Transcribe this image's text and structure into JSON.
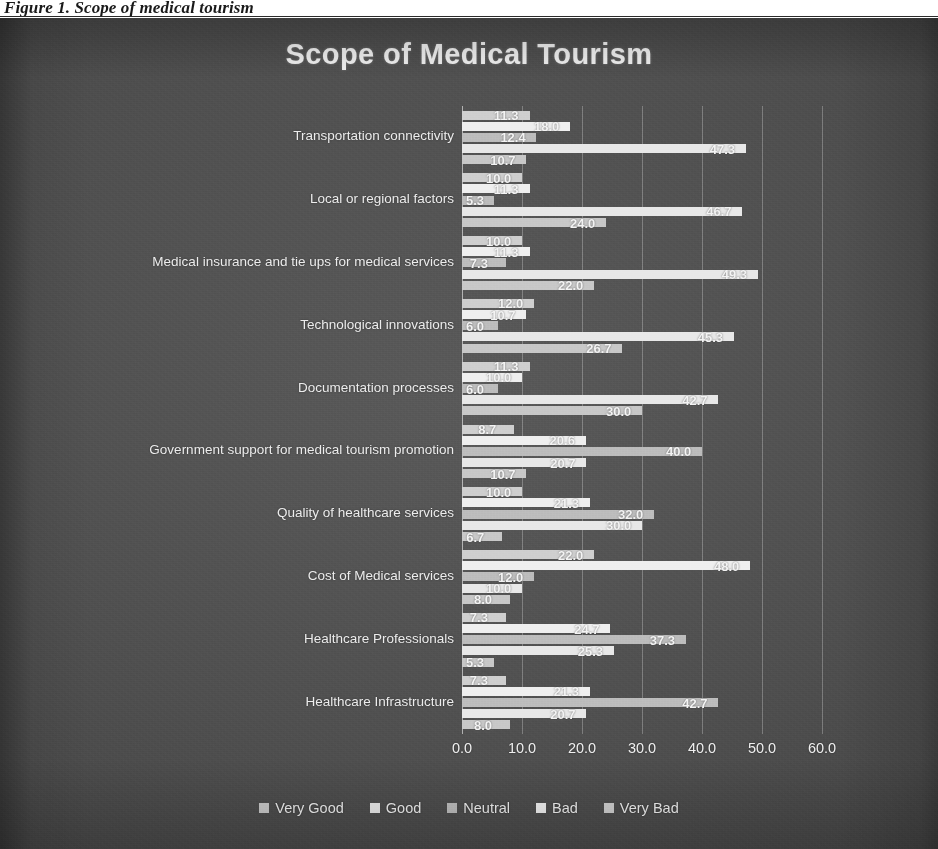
{
  "caption": "Figure 1. Scope of medical tourism",
  "chart_data": {
    "type": "bar",
    "orientation": "horizontal",
    "title": "Scope of Medical Tourism",
    "xlabel": "",
    "ylabel": "",
    "xlim": [
      0.0,
      60.0
    ],
    "xticks": [
      "0.0",
      "10.0",
      "20.0",
      "30.0",
      "40.0",
      "50.0",
      "60.0"
    ],
    "grid": true,
    "legend_position": "bottom",
    "bar_order_top_to_bottom": [
      "Very Bad",
      "Bad",
      "Neutral",
      "Good",
      "Very Good"
    ],
    "categories": [
      "Transportation connectivity",
      "Local or regional factors",
      "Medical insurance and tie ups for medical services",
      "Technological innovations",
      "Documentation processes",
      "Government support for medical tourism promotion",
      "Quality of healthcare services",
      "Cost of Medical services",
      "Healthcare Professionals",
      "Healthcare Infrastructure"
    ],
    "series": [
      {
        "name": "Very Good",
        "color": "#c8c8c8",
        "values": [
          10.7,
          24.0,
          22.0,
          26.7,
          30.0,
          10.7,
          6.7,
          8.0,
          5.3,
          8.0
        ]
      },
      {
        "name": "Good",
        "color": "#e8e8e8",
        "values": [
          47.3,
          46.7,
          49.3,
          45.3,
          42.7,
          20.7,
          30.0,
          10.0,
          25.3,
          20.7
        ]
      },
      {
        "name": "Neutral",
        "color": "#bdbdbd",
        "values": [
          12.4,
          5.3,
          7.3,
          6.0,
          6.0,
          40.0,
          32.0,
          12.0,
          37.3,
          42.7
        ]
      },
      {
        "name": "Bad",
        "color": "#efefef",
        "values": [
          18.0,
          11.3,
          11.3,
          10.7,
          10.0,
          20.6,
          21.3,
          48.0,
          24.7,
          21.3
        ]
      },
      {
        "name": "Very Bad",
        "color": "#cfcfcf",
        "values": [
          11.3,
          10.0,
          10.0,
          12.0,
          11.3,
          8.7,
          10.0,
          22.0,
          7.3,
          7.3
        ]
      }
    ],
    "data_labels": [
      [
        "11.3",
        "18.0",
        "12.4",
        "47.3",
        "10.7"
      ],
      [
        "10.0",
        "11.3",
        "5.3",
        "46.7",
        "24.0"
      ],
      [
        "10.0",
        "11.3",
        "7.3",
        "49.3",
        "22.0"
      ],
      [
        "12.0",
        "10.7",
        "6.0",
        "45.3",
        "26.7"
      ],
      [
        "11.3",
        "10.0",
        "6.0",
        "42.7",
        "30.0"
      ],
      [
        "8.7",
        "20.6",
        "40.0",
        "20.7",
        "10.7"
      ],
      [
        "10.0",
        "21.3",
        "32.0",
        "30.0",
        "6.7"
      ],
      [
        "22.0",
        "48.0",
        "12.0",
        "10.0",
        "8.0"
      ],
      [
        "7.3",
        "24.7",
        "37.3",
        "25.3",
        "5.3"
      ],
      [
        "7.3",
        "21.3",
        "42.7",
        "20.7",
        "8.0"
      ]
    ]
  },
  "legend": {
    "items": [
      {
        "label": "Very Good",
        "color": "#c8c8c8"
      },
      {
        "label": "Good",
        "color": "#e8e8e8"
      },
      {
        "label": "Neutral",
        "color": "#bdbdbd"
      },
      {
        "label": "Bad",
        "color": "#efefef"
      },
      {
        "label": "Very Bad",
        "color": "#cfcfcf"
      }
    ]
  }
}
